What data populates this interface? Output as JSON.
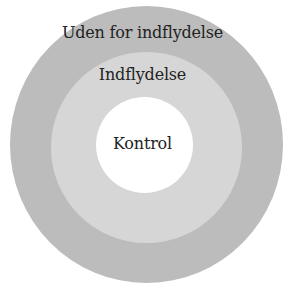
{
  "diagram": {
    "type": "concentric-circles",
    "rings": [
      {
        "id": "outer",
        "label": "Uden for indflydelse",
        "color": "#bcbcbc"
      },
      {
        "id": "middle",
        "label": "Indflydelse",
        "color": "#d6d6d6"
      },
      {
        "id": "inner",
        "label": "Kontrol",
        "color": "#ffffff"
      }
    ]
  }
}
